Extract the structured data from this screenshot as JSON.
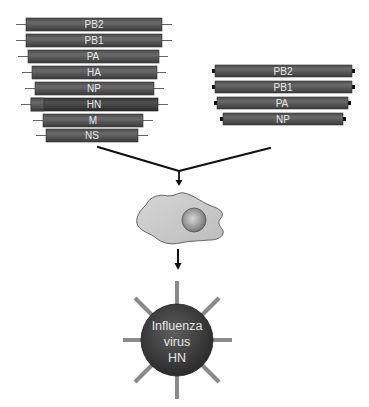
{
  "diagram": {
    "type": "reverse-genetics-schematic",
    "left_segments": [
      {
        "label": "PB2",
        "x": 26,
        "y": 18,
        "w": 136
      },
      {
        "label": "PB1",
        "x": 26,
        "y": 34,
        "w": 136
      },
      {
        "label": "PA",
        "x": 28,
        "y": 50,
        "w": 131
      },
      {
        "label": "HA",
        "x": 32,
        "y": 66,
        "w": 125
      },
      {
        "label": "NP",
        "x": 35,
        "y": 82,
        "w": 119
      },
      {
        "label": "HN",
        "x": 31,
        "y": 98,
        "w": 127
      },
      {
        "label": "M",
        "x": 43,
        "y": 114,
        "w": 100
      },
      {
        "label": "NS",
        "x": 46,
        "y": 129,
        "w": 92
      }
    ],
    "right_segments": [
      {
        "label": "PB2",
        "x": 215,
        "y": 65,
        "w": 137
      },
      {
        "label": "PB1",
        "x": 215,
        "y": 81,
        "w": 137
      },
      {
        "label": "PA",
        "x": 217,
        "y": 97,
        "w": 131
      },
      {
        "label": "NP",
        "x": 223,
        "y": 113,
        "w": 120
      }
    ],
    "cell": {
      "label": "host cell"
    },
    "virus": {
      "line1": "Influenza",
      "line2": "virus",
      "line3": "HN"
    },
    "colors": {
      "segment_fill": "#5a5a5a",
      "segment_dark": "#3e3e3e",
      "hn_insert": "#6e6e6e",
      "cap": "#111111",
      "line": "#111111",
      "cell_fill": "#cfcfcf",
      "nucleus": "#9a9a9a",
      "virus_fill": "#3c3c3c",
      "spike": "#8a8a8a"
    }
  }
}
